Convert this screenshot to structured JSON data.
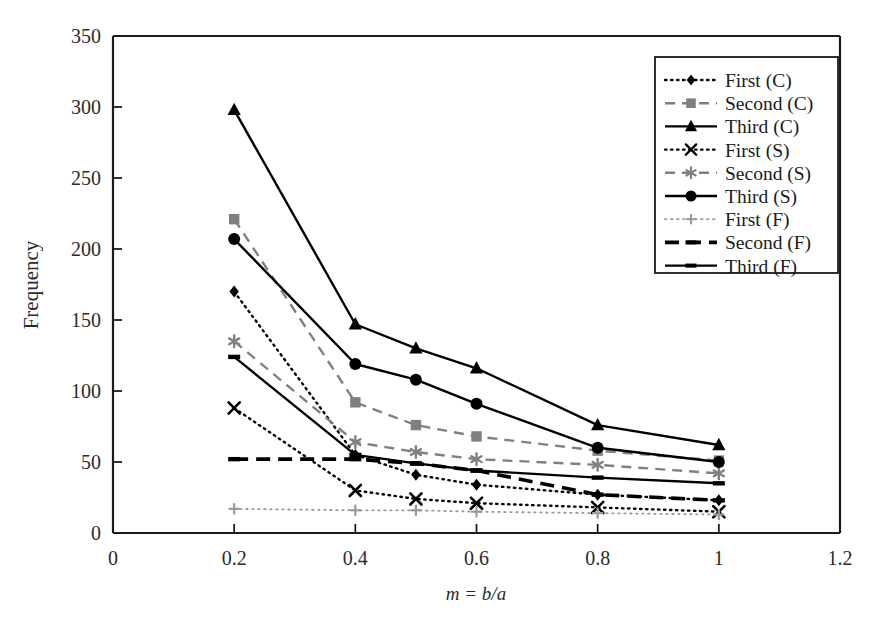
{
  "chart_data": {
    "type": "line",
    "title": "",
    "subtitle": "",
    "xlabel": "m = b/a",
    "ylabel": "Frequency",
    "xlim": [
      0,
      1.2
    ],
    "ylim": [
      0,
      350
    ],
    "xticks": [
      "0",
      "0.2",
      "0.4",
      "0.6",
      "0.8",
      "1",
      "1.2"
    ],
    "xtick_values": [
      0,
      0.2,
      0.4,
      0.6,
      0.8,
      1.0,
      1.2
    ],
    "yticks": [
      "0",
      "50",
      "100",
      "150",
      "200",
      "250",
      "300",
      "350"
    ],
    "ytick_values": [
      0,
      50,
      100,
      150,
      200,
      250,
      300,
      350
    ],
    "grid": false,
    "legend_position": "top-right",
    "x": [
      0.2,
      0.4,
      0.5,
      0.6,
      0.8,
      1.0
    ],
    "series": [
      {
        "name": "First (C)",
        "marker": "diamond",
        "linestyle": "dotted",
        "color": "#000000",
        "values": [
          170,
          55,
          41,
          34,
          27,
          23
        ]
      },
      {
        "name": "Second (C)",
        "marker": "square",
        "linestyle": "dashed",
        "color": "#808080",
        "values": [
          221,
          92,
          76,
          68,
          58,
          51
        ]
      },
      {
        "name": "Third (C)",
        "marker": "triangle",
        "linestyle": "solid",
        "color": "#000000",
        "values": [
          298,
          147,
          130,
          116,
          76,
          62
        ]
      },
      {
        "name": "First (S)",
        "marker": "x",
        "linestyle": "dotted",
        "color": "#000000",
        "values": [
          88,
          30,
          24,
          21,
          18,
          15
        ]
      },
      {
        "name": "Second (S)",
        "marker": "asterisk",
        "linestyle": "dashed",
        "color": "#808080",
        "values": [
          135,
          64,
          57,
          52,
          48,
          42
        ]
      },
      {
        "name": "Third (S)",
        "marker": "circle",
        "linestyle": "solid",
        "color": "#000000",
        "values": [
          207,
          119,
          108,
          91,
          60,
          50
        ]
      },
      {
        "name": "First (F)",
        "marker": "plus",
        "linestyle": "dotted-thin",
        "color": "#9a9a9a",
        "values": [
          17,
          16,
          16,
          15,
          14,
          13
        ]
      },
      {
        "name": "Second (F)",
        "marker": "dash",
        "linestyle": "bold-dashed",
        "color": "#000000",
        "values": [
          52,
          52,
          49,
          44,
          27,
          23
        ]
      },
      {
        "name": "Third (F)",
        "marker": "dash",
        "linestyle": "solid",
        "color": "#000000",
        "values": [
          124,
          55,
          49,
          44,
          39,
          35
        ]
      }
    ]
  },
  "legend": {
    "items": [
      "First (C)",
      "Second (C)",
      "Third (C)",
      "First (S)",
      "Second (S)",
      "Third (S)",
      "First (F)",
      "Second (F)",
      "Third (F)"
    ]
  },
  "axes": {
    "y_title": "Frequency",
    "x_title_parts": {
      "m": "m",
      "eq": "=",
      "b": "b",
      "slash": "/",
      "a": "a"
    },
    "x_title": "m = b/a"
  },
  "colors": {
    "frame": "#1a1a1a",
    "black": "#000000",
    "gray": "#808080",
    "light_gray": "#9a9a9a",
    "background": "#ffffff"
  }
}
